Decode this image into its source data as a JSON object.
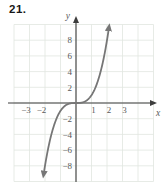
{
  "problem_number": "21.",
  "colors": {
    "curve": "#767676",
    "grid": "#e1e6e0",
    "axis": "#3d3d3d",
    "tick_text": "#5a5a5a",
    "problem_text": "#171717",
    "background": "#ffffff"
  },
  "chart_data": {
    "type": "line",
    "title": "",
    "function": "y = x^3",
    "xlabel": "x",
    "ylabel": "y",
    "xlim": [
      -4,
      5
    ],
    "ylim": [
      -10,
      10
    ],
    "x_grid_step": 1,
    "y_grid_step": 2,
    "grid": true,
    "legend": false,
    "x_tick_labels": [
      -3,
      -2,
      1,
      2,
      3
    ],
    "y_tick_labels": [
      8,
      6,
      4,
      2,
      -2,
      -4,
      -6,
      -8
    ],
    "curve_x_range": [
      -2.08,
      2.13
    ],
    "curve_arrows": "both-ends",
    "axis_arrows": "positive-ends",
    "points": [
      [
        -2,
        -8
      ],
      [
        -1,
        -1
      ],
      [
        0,
        0
      ],
      [
        1,
        1
      ],
      [
        2,
        8
      ]
    ]
  }
}
